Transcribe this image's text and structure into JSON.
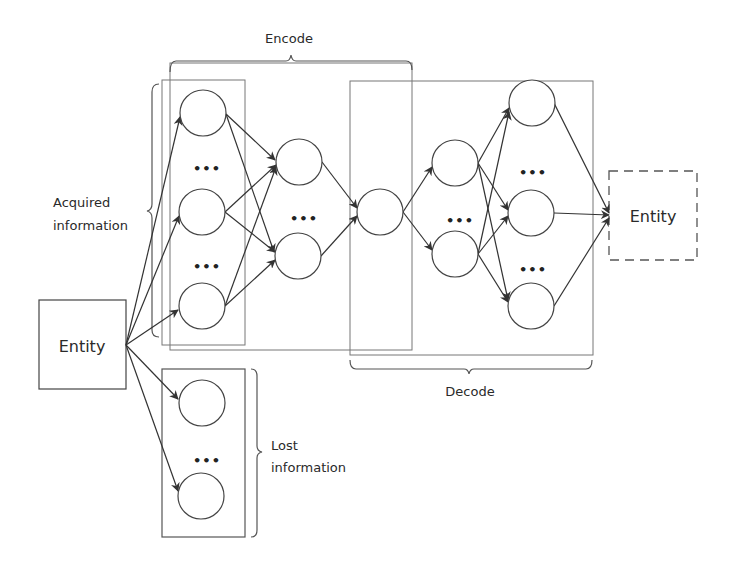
{
  "diagram": {
    "title": "",
    "labels": {
      "encode": "Encode",
      "decode": "Decode",
      "acquired_line1": "Acquired",
      "acquired_line2": "information",
      "lost_line1": "Lost",
      "lost_line2": "information",
      "input_entity": "Entity",
      "output_entity": "Entity",
      "ellipsis": "•••"
    },
    "nodes": {
      "input_entity": {
        "x": 39,
        "y": 300,
        "w": 87,
        "h": 89,
        "style": "solid"
      },
      "output_entity": {
        "x": 609,
        "y": 171,
        "w": 88,
        "h": 89,
        "style": "dashed"
      },
      "layer1": [
        [
          203,
          113
        ],
        [
          202,
          212
        ],
        [
          202,
          306
        ]
      ],
      "layer2": [
        [
          299,
          162
        ],
        [
          298,
          256
        ]
      ],
      "bottleneck": [
        [
          380,
          212
        ]
      ],
      "layer4": [
        [
          455,
          163
        ],
        [
          455,
          254
        ]
      ],
      "layer5": [
        [
          532,
          103
        ],
        [
          531,
          213
        ],
        [
          531,
          306
        ]
      ],
      "lost": [
        [
          202,
          403
        ],
        [
          201,
          496
        ]
      ]
    },
    "groups": [
      {
        "name": "acquired-layer-box",
        "x": 162,
        "y": 80,
        "w": 83,
        "h": 265
      },
      {
        "name": "encode-box",
        "x": 170,
        "y": 63,
        "w": 242,
        "h": 287
      },
      {
        "name": "decode-box",
        "x": 350,
        "y": 81,
        "w": 243,
        "h": 274
      },
      {
        "name": "lost-box",
        "x": 162,
        "y": 369,
        "w": 83,
        "h": 168
      }
    ],
    "colors": {
      "stroke": "#3a3a3a",
      "box_stroke": "#6a6a6a",
      "background": "#ffffff"
    }
  }
}
